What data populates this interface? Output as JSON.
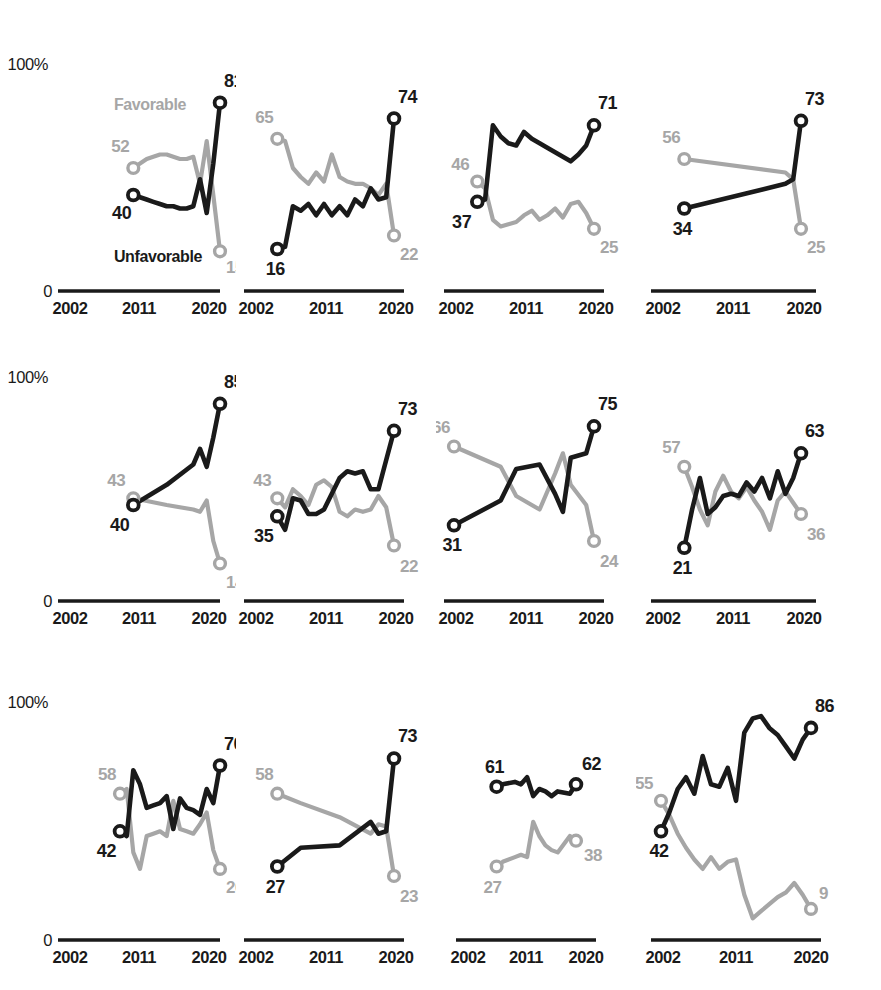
{
  "meta": {
    "series_labels": {
      "favorable": "Favorable",
      "unfavorable": "Unfavorable"
    },
    "colors": {
      "favorable": "#a6a6a6",
      "unfavorable": "#1a1a1a",
      "axis": "#1a1a1a",
      "background": "#ffffff"
    },
    "y_top_label": "100%",
    "y_bottom_label": "0",
    "x_ticks": [
      "2002",
      "2011",
      "2020"
    ]
  },
  "chart_data": {
    "type": "line",
    "title": "",
    "subtitle": "",
    "xlabel": "",
    "ylabel": "",
    "ylim": [
      0,
      100
    ],
    "xlim": [
      2002,
      2020
    ],
    "grid": false,
    "legend": "inline-annotations",
    "series_names": [
      "Favorable",
      "Unfavorable"
    ],
    "panels": [
      {
        "name": "Australia",
        "row": 0,
        "col": 0,
        "endpoint_labels": {
          "unfavorable_start": "40",
          "unfavorable_end": "81",
          "favorable_start": "52",
          "favorable_end": "15"
        },
        "favorable": {
          "x": [
            2007,
            2008,
            2009,
            2010,
            2011,
            2012,
            2013,
            2014,
            2015,
            2016,
            2017,
            2018,
            2019,
            2020
          ],
          "y": [
            52,
            54,
            56,
            57,
            58,
            58,
            57,
            56,
            56,
            57,
            45,
            64,
            40,
            15
          ]
        },
        "unfavorable": {
          "x": [
            2007,
            2008,
            2009,
            2010,
            2011,
            2012,
            2013,
            2014,
            2015,
            2016,
            2017,
            2018,
            2019,
            2020
          ],
          "y": [
            40,
            39,
            38,
            37,
            36,
            35,
            35,
            34,
            34,
            35,
            47,
            32,
            54,
            81
          ]
        }
      },
      {
        "name": "UK",
        "row": 0,
        "col": 1,
        "endpoint_labels": {
          "unfavorable_start": "16",
          "unfavorable_end": "74",
          "favorable_start": "65",
          "favorable_end": "22"
        },
        "favorable": {
          "x": [
            2005,
            2006,
            2007,
            2008,
            2009,
            2010,
            2011,
            2012,
            2013,
            2014,
            2015,
            2016,
            2017,
            2018,
            2019,
            2020
          ],
          "y": [
            65,
            64,
            52,
            48,
            45,
            50,
            46,
            58,
            48,
            46,
            45,
            45,
            43,
            40,
            45,
            22
          ]
        },
        "unfavorable": {
          "x": [
            2005,
            2006,
            2007,
            2008,
            2009,
            2010,
            2011,
            2012,
            2013,
            2014,
            2015,
            2016,
            2017,
            2018,
            2019,
            2020
          ],
          "y": [
            16,
            17,
            35,
            33,
            36,
            31,
            36,
            31,
            35,
            31,
            38,
            35,
            43,
            38,
            39,
            74
          ]
        }
      },
      {
        "name": "Germany",
        "row": 0,
        "col": 2,
        "endpoint_labels": {
          "unfavorable_start": "37",
          "unfavorable_end": "71",
          "favorable_start": "46",
          "favorable_end": "25"
        },
        "favorable": {
          "x": [
            2005,
            2006,
            2007,
            2008,
            2009,
            2010,
            2011,
            2012,
            2013,
            2014,
            2015,
            2016,
            2017,
            2018,
            2019,
            2020
          ],
          "y": [
            46,
            43,
            29,
            26,
            27,
            28,
            31,
            33,
            29,
            31,
            34,
            30,
            36,
            37,
            32,
            25
          ]
        },
        "unfavorable": {
          "x": [
            2005,
            2006,
            2007,
            2008,
            2009,
            2010,
            2011,
            2012,
            2013,
            2014,
            2015,
            2016,
            2017,
            2018,
            2019,
            2020
          ],
          "y": [
            37,
            38,
            71,
            66,
            63,
            62,
            68,
            65,
            63,
            61,
            59,
            57,
            55,
            58,
            62,
            71
          ]
        }
      },
      {
        "name": "Netherlands",
        "row": 0,
        "col": 3,
        "endpoint_labels": {
          "unfavorable_start": "34",
          "unfavorable_end": "73",
          "favorable_start": "56",
          "favorable_end": "25"
        },
        "favorable": {
          "x": [
            2005,
            2018,
            2019,
            2020
          ],
          "y": [
            56,
            50,
            47,
            25
          ]
        },
        "unfavorable": {
          "x": [
            2005,
            2018,
            2019,
            2020
          ],
          "y": [
            34,
            45,
            47,
            73
          ]
        }
      },
      {
        "name": "Sweden",
        "row": 1,
        "col": 0,
        "endpoint_labels": {
          "unfavorable_start": "40",
          "unfavorable_end": "85",
          "favorable_start": "43",
          "favorable_end": "14"
        },
        "favorable": {
          "x": [
            2007,
            2012,
            2016,
            2017,
            2018,
            2019,
            2020
          ],
          "y": [
            43,
            40,
            38,
            37,
            42,
            24,
            14
          ]
        },
        "unfavorable": {
          "x": [
            2007,
            2012,
            2016,
            2017,
            2018,
            2019,
            2020
          ],
          "y": [
            40,
            49,
            58,
            65,
            57,
            70,
            85
          ]
        }
      },
      {
        "name": "US",
        "row": 1,
        "col": 1,
        "endpoint_labels": {
          "unfavorable_start": "35",
          "unfavorable_end": "73",
          "favorable_start": "43",
          "favorable_end": "22"
        },
        "favorable": {
          "x": [
            2005,
            2006,
            2007,
            2008,
            2009,
            2010,
            2011,
            2012,
            2013,
            2014,
            2015,
            2016,
            2017,
            2018,
            2019,
            2020
          ],
          "y": [
            43,
            39,
            47,
            44,
            40,
            49,
            51,
            48,
            37,
            35,
            38,
            37,
            38,
            44,
            39,
            22
          ]
        },
        "unfavorable": {
          "x": [
            2005,
            2006,
            2007,
            2008,
            2009,
            2010,
            2011,
            2012,
            2013,
            2014,
            2015,
            2016,
            2017,
            2018,
            2019,
            2020
          ],
          "y": [
            35,
            29,
            43,
            42,
            36,
            36,
            38,
            45,
            52,
            55,
            54,
            55,
            47,
            47,
            60,
            73
          ]
        }
      },
      {
        "name": "South Korea",
        "row": 1,
        "col": 2,
        "endpoint_labels": {
          "unfavorable_start": "31",
          "unfavorable_end": "75",
          "favorable_start": "66",
          "favorable_end": "24"
        },
        "favorable": {
          "x": [
            2002,
            2008,
            2010,
            2013,
            2015,
            2016,
            2017,
            2019,
            2020
          ],
          "y": [
            66,
            57,
            44,
            38,
            54,
            63,
            49,
            40,
            24
          ]
        },
        "unfavorable": {
          "x": [
            2002,
            2008,
            2010,
            2013,
            2015,
            2016,
            2017,
            2019,
            2020
          ],
          "y": [
            31,
            42,
            56,
            58,
            45,
            37,
            61,
            63,
            75
          ]
        }
      },
      {
        "name": "Spain",
        "row": 1,
        "col": 3,
        "endpoint_labels": {
          "unfavorable_start": "21",
          "unfavorable_end": "63",
          "favorable_start": "57",
          "favorable_end": "36"
        },
        "favorable": {
          "x": [
            2005,
            2006,
            2007,
            2008,
            2009,
            2010,
            2011,
            2012,
            2013,
            2014,
            2015,
            2016,
            2017,
            2018,
            2019,
            2020
          ],
          "y": [
            57,
            48,
            38,
            31,
            46,
            53,
            46,
            43,
            48,
            42,
            37,
            29,
            42,
            46,
            41,
            36
          ]
        },
        "unfavorable": {
          "x": [
            2005,
            2006,
            2007,
            2008,
            2009,
            2010,
            2011,
            2012,
            2013,
            2014,
            2015,
            2016,
            2017,
            2018,
            2019,
            2020
          ],
          "y": [
            21,
            38,
            52,
            36,
            39,
            44,
            45,
            44,
            50,
            46,
            52,
            43,
            55,
            45,
            52,
            63
          ]
        }
      },
      {
        "name": "France",
        "row": 2,
        "col": 0,
        "endpoint_labels": {
          "unfavorable_start": "42",
          "unfavorable_end": "70",
          "favorable_start": "58",
          "favorable_end": "26"
        },
        "favorable": {
          "x": [
            2005,
            2006,
            2007,
            2008,
            2009,
            2010,
            2011,
            2012,
            2013,
            2014,
            2015,
            2016,
            2017,
            2018,
            2019,
            2020
          ],
          "y": [
            58,
            60,
            33,
            26,
            40,
            41,
            42,
            40,
            55,
            43,
            42,
            41,
            45,
            50,
            34,
            26
          ]
        },
        "unfavorable": {
          "x": [
            2005,
            2006,
            2007,
            2008,
            2009,
            2010,
            2011,
            2012,
            2013,
            2014,
            2015,
            2016,
            2017,
            2018,
            2019,
            2020
          ],
          "y": [
            42,
            40,
            68,
            62,
            52,
            53,
            54,
            57,
            43,
            56,
            52,
            51,
            49,
            60,
            54,
            70
          ]
        }
      },
      {
        "name": "Canada",
        "row": 2,
        "col": 1,
        "endpoint_labels": {
          "unfavorable_start": "27",
          "unfavorable_end": "73",
          "favorable_start": "58",
          "favorable_end": "23"
        },
        "favorable": {
          "x": [
            2005,
            2008,
            2013,
            2017,
            2018,
            2019,
            2020
          ],
          "y": [
            58,
            54,
            48,
            41,
            45,
            44,
            23
          ]
        },
        "unfavorable": {
          "x": [
            2005,
            2008,
            2013,
            2017,
            2018,
            2019,
            2020
          ],
          "y": [
            27,
            35,
            36,
            46,
            41,
            42,
            73
          ]
        }
      },
      {
        "name": "Italy",
        "row": 2,
        "col": 2,
        "endpoint_labels": {
          "unfavorable_start": "61",
          "unfavorable_end": "62",
          "favorable_start": "27",
          "favorable_end": "38"
        },
        "favorable": {
          "x": [
            2007,
            2008,
            2010,
            2011,
            2012,
            2013,
            2014,
            2015,
            2016,
            2017,
            2019,
            2020
          ],
          "y": [
            27,
            29,
            31,
            32,
            31,
            46,
            40,
            36,
            34,
            33,
            40,
            38
          ]
        },
        "unfavorable": {
          "x": [
            2007,
            2008,
            2010,
            2011,
            2012,
            2013,
            2014,
            2015,
            2016,
            2017,
            2019,
            2020
          ],
          "y": [
            61,
            62,
            63,
            62,
            65,
            57,
            60,
            59,
            57,
            59,
            58,
            62
          ]
        }
      },
      {
        "name": "Japan",
        "row": 2,
        "col": 3,
        "endpoint_labels": {
          "unfavorable_start": "42",
          "unfavorable_end": "86",
          "favorable_start": "55",
          "favorable_end": "9"
        },
        "favorable": {
          "x": [
            2002,
            2003,
            2004,
            2005,
            2006,
            2007,
            2008,
            2009,
            2010,
            2011,
            2012,
            2013,
            2014,
            2015,
            2016,
            2017,
            2018,
            2019,
            2020
          ],
          "y": [
            55,
            49,
            41,
            35,
            30,
            26,
            31,
            26,
            29,
            30,
            15,
            5,
            8,
            11,
            14,
            16,
            20,
            15,
            9
          ]
        },
        "unfavorable": {
          "x": [
            2002,
            2003,
            2004,
            2005,
            2006,
            2007,
            2008,
            2009,
            2010,
            2011,
            2012,
            2013,
            2014,
            2015,
            2016,
            2017,
            2018,
            2019,
            2020
          ],
          "y": [
            42,
            50,
            60,
            65,
            58,
            74,
            62,
            61,
            69,
            55,
            84,
            90,
            91,
            86,
            83,
            78,
            73,
            81,
            86
          ]
        }
      }
    ]
  }
}
